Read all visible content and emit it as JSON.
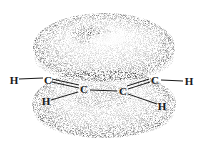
{
  "diagram": {
    "colors": {
      "background": "#ffffff",
      "stipple": "#1a1a1a",
      "bond": "#1a1a1a"
    },
    "clouds": [
      {
        "name": "upper-pi-cloud",
        "cx": 104,
        "cy": 47,
        "rx": 70,
        "ry": 33
      },
      {
        "name": "lower-pi-cloud",
        "cx": 104,
        "cy": 103,
        "rx": 70,
        "ry": 33
      }
    ],
    "atoms": [
      {
        "id": "h1",
        "label": "H",
        "x": 14,
        "y": 80
      },
      {
        "id": "c1",
        "label": "C",
        "x": 48,
        "y": 80
      },
      {
        "id": "h2",
        "label": "H",
        "x": 46,
        "y": 101
      },
      {
        "id": "c2",
        "label": "C",
        "x": 84,
        "y": 89
      },
      {
        "id": "c3",
        "label": "C",
        "x": 123,
        "y": 91
      },
      {
        "id": "c4",
        "label": "C",
        "x": 155,
        "y": 80
      },
      {
        "id": "h3",
        "label": "H",
        "x": 189,
        "y": 81
      },
      {
        "id": "h4",
        "label": "H",
        "x": 162,
        "y": 106
      }
    ],
    "bonds": [
      {
        "from": "h1",
        "to": "c1"
      },
      {
        "from": "c1",
        "to": "c2"
      },
      {
        "from": "c2",
        "to": "h2"
      },
      {
        "from": "c2",
        "to": "c3"
      },
      {
        "from": "c3",
        "to": "c4"
      },
      {
        "from": "c3",
        "to": "h4"
      },
      {
        "from": "c4",
        "to": "h3"
      }
    ]
  }
}
